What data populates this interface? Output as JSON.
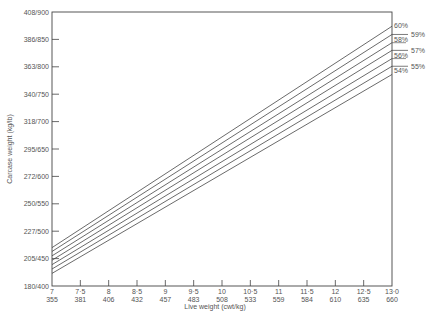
{
  "chart_data": {
    "type": "line",
    "title": "",
    "xlabel": "Live weight (cwt/kg)",
    "ylabel": "Carcase weight (kg/lb)",
    "x_ticks": [
      {
        "top": "7",
        "bottom": "355",
        "cwt": 7
      },
      {
        "top": "7·5",
        "bottom": "381",
        "cwt": 7.5
      },
      {
        "top": "8",
        "bottom": "406",
        "cwt": 8
      },
      {
        "top": "8·5",
        "bottom": "432",
        "cwt": 8.5
      },
      {
        "top": "9",
        "bottom": "457",
        "cwt": 9
      },
      {
        "top": "9·5",
        "bottom": "483",
        "cwt": 9.5
      },
      {
        "top": "10",
        "bottom": "508",
        "cwt": 10
      },
      {
        "top": "10·5",
        "bottom": "533",
        "cwt": 10.5
      },
      {
        "top": "11",
        "bottom": "559",
        "cwt": 11
      },
      {
        "top": "11·5",
        "bottom": "584",
        "cwt": 11.5
      },
      {
        "top": "12",
        "bottom": "610",
        "cwt": 12
      },
      {
        "top": "12·5",
        "bottom": "635",
        "cwt": 12.5
      },
      {
        "top": "13·0",
        "bottom": "660",
        "cwt": 13
      }
    ],
    "y_ticks": [
      {
        "label": "180/400",
        "lb": 400
      },
      {
        "label": "205/450",
        "lb": 450
      },
      {
        "label": "227/500",
        "lb": 500
      },
      {
        "label": "250/550",
        "lb": 550
      },
      {
        "label": "272/600",
        "lb": 600
      },
      {
        "label": "295/650",
        "lb": 650
      },
      {
        "label": "318/700",
        "lb": 700
      },
      {
        "label": "340/750",
        "lb": 750
      },
      {
        "label": "363/800",
        "lb": 800
      },
      {
        "label": "386/850",
        "lb": 850
      },
      {
        "label": "408/900",
        "lb": 900
      }
    ],
    "xlim_cwt": [
      7,
      13
    ],
    "ylim_lb": [
      400,
      900
    ],
    "grid": false,
    "legend_position": "right, inline labels at line ends",
    "x": [
      7,
      13
    ],
    "series": [
      {
        "name": "60%",
        "values_lb": [
          470,
          874
        ]
      },
      {
        "name": "59%",
        "values_lb": [
          463,
          859
        ]
      },
      {
        "name": "58%",
        "values_lb": [
          455,
          844
        ]
      },
      {
        "name": "57%",
        "values_lb": [
          447,
          830
        ]
      },
      {
        "name": "56%",
        "values_lb": [
          439,
          815
        ]
      },
      {
        "name": "55%",
        "values_lb": [
          431,
          801
        ]
      },
      {
        "name": "54%",
        "values_lb": [
          423,
          786
        ]
      }
    ]
  },
  "colors": {
    "line": "#444444",
    "text": "#555555",
    "background": "#ffffff"
  }
}
